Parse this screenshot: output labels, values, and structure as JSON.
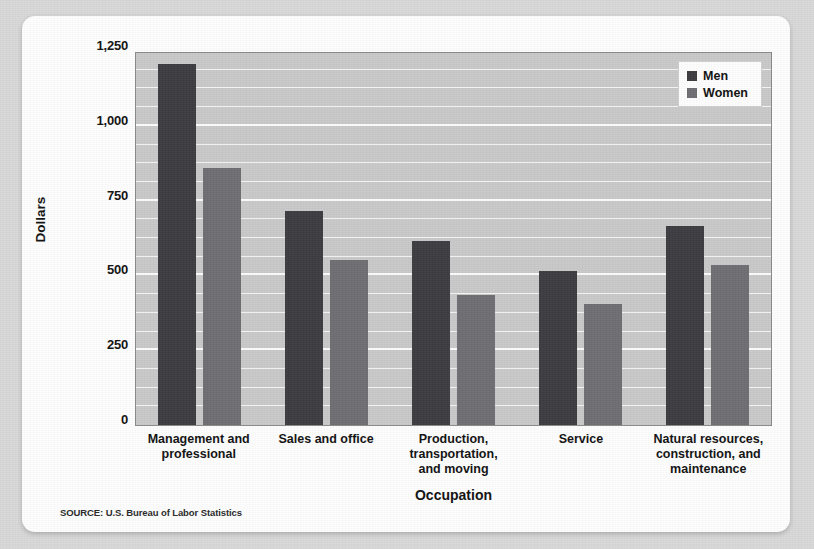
{
  "figure": {
    "clipped_title": "",
    "source_note": "SOURCE: U.S. Bureau of Labor Statistics"
  },
  "legend": {
    "position": "top-right-inside",
    "entries": [
      {
        "label": "Men",
        "color": "#3c3c41"
      },
      {
        "label": "Women",
        "color": "#6e6e73"
      }
    ]
  },
  "chart_data": {
    "type": "bar",
    "title": "",
    "xlabel": "Occupation",
    "ylabel": "Dollars",
    "ylim": [
      0,
      1250
    ],
    "yticks": [
      0,
      250,
      500,
      750,
      1000,
      1250
    ],
    "ytick_labels": [
      "0",
      "250",
      "500",
      "750",
      "1,000",
      "1,250"
    ],
    "minor_gridline_step": 62.5,
    "grid": true,
    "grid_axis": "y",
    "categories": [
      "Management and professional",
      "Sales and office",
      "Production, transportation, and moving",
      "Service",
      "Natural resources, construction, and maintenance"
    ],
    "category_label_lines": [
      [
        "Management and",
        "professional"
      ],
      [
        "Sales and office"
      ],
      [
        "Production,",
        "transportation,",
        "and moving"
      ],
      [
        "Service"
      ],
      [
        "Natural resources,",
        "construction, and",
        "maintenance"
      ]
    ],
    "series": [
      {
        "name": "Men",
        "color": "#3c3c41",
        "values": [
          1205,
          715,
          615,
          515,
          665
        ]
      },
      {
        "name": "Women",
        "color": "#6e6e73",
        "values": [
          860,
          550,
          435,
          405,
          535
        ]
      }
    ]
  }
}
